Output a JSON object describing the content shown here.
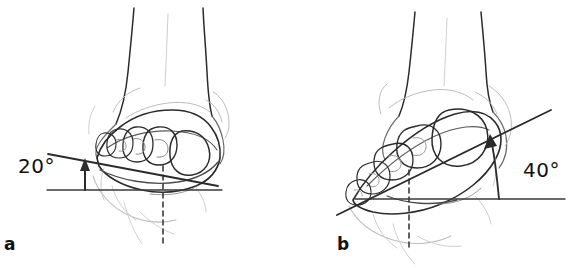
{
  "figure": {
    "background_color": "#ffffff",
    "width": 578,
    "height": 268,
    "style": "anatomical line drawing"
  },
  "panels": [
    {
      "id": "a",
      "caption": "a",
      "angle_label": "20°",
      "angle_value": 20,
      "description": "Posterior view of foot held in plantar flexion measured at 20 degrees from the horizontal reference line",
      "elements": {
        "baseline_name": "horizontal-reference-line",
        "angled_line_name": "plantar-flexion-axis-line",
        "dashed_line_name": "vertical-dashed-reference-line",
        "arrow_name": "angle-arrow-up"
      }
    },
    {
      "id": "b",
      "caption": "b",
      "angle_label": "40°",
      "angle_value": 40,
      "description": "Posterior view of foot held in plantar flexion measured at 40 degrees from the horizontal reference line",
      "elements": {
        "baseline_name": "horizontal-reference-line",
        "angled_line_name": "plantar-flexion-axis-line",
        "dashed_line_name": "vertical-dashed-reference-line",
        "arrow_name": "angle-arrow-up"
      }
    }
  ],
  "colors": {
    "ink_dark": "#2b2b2b",
    "ink_mid": "#555555",
    "ink_light": "#9a9a9a",
    "ink_faint": "#bdbdbd",
    "text": "#111111",
    "background": "#ffffff"
  }
}
